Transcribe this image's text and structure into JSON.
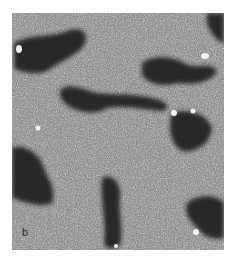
{
  "figure": {
    "panel_label": "b",
    "colors": {
      "background": "#ffffff",
      "dark_region": "#1e1e1e",
      "grain_light": "#e8e8e8",
      "grain_dark": "#3a3a3a"
    }
  }
}
